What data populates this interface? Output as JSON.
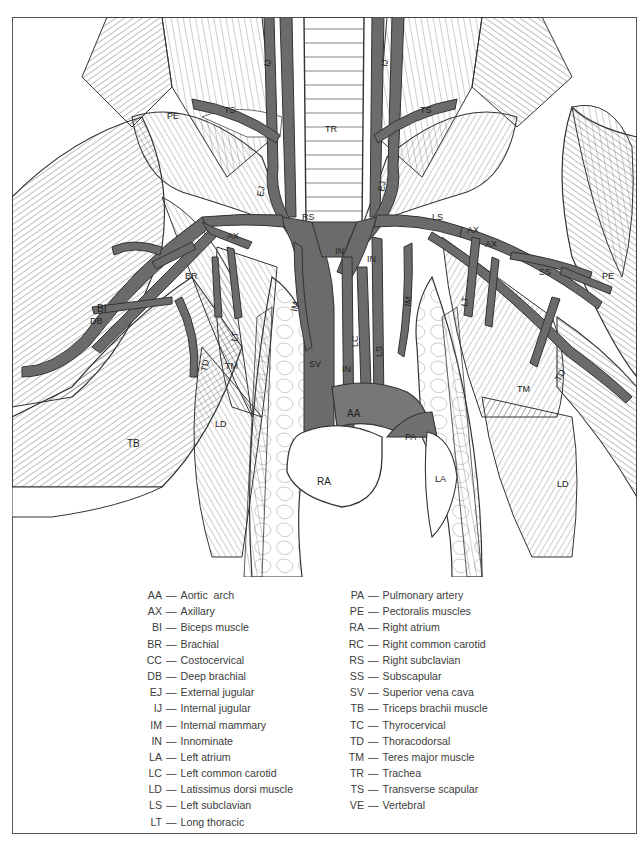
{
  "figure": {
    "vessel_color": "#6b6b6b",
    "heart_color": "#777777",
    "labels": {
      "TR": "TR",
      "EJ_left": "EJ",
      "EJ_right": "EJ",
      "IJ_left": "IJ",
      "IJ_right": "IJ",
      "RS": "RS",
      "LS": "LS",
      "IN_left": "IN",
      "IN_center": "IN",
      "IN_lower": "IN",
      "SV": "SV",
      "RC": "RC",
      "LC": "LC",
      "LS_lower": "LS",
      "IM_left": "IM",
      "IM_right": "IM",
      "AA": "AA",
      "PA": "PA",
      "RA": "RA",
      "LA": "LA",
      "AX_left1": "AX",
      "AX_left2": "AX",
      "AX_right1": "AX",
      "AX_right2": "AX",
      "BI": "BI",
      "BR": "BR",
      "DB": "DB",
      "TB": "TB",
      "TD_left": "TD",
      "TD_right": "TD",
      "TM_left": "TM",
      "TM_right": "TM",
      "LD_left": "LD",
      "LD_right": "LD",
      "LT_left": "LT",
      "LT_right": "LT",
      "PE_left": "PE",
      "PE_right": "PE",
      "TS_left": "TS",
      "TS_right": "TS",
      "SS": "SS",
      "VE": "VE",
      "TC": "TC"
    }
  },
  "legend": {
    "dash": "—",
    "left": [
      {
        "abbr": "AA",
        "name": "Aortic  arch"
      },
      {
        "abbr": "AX",
        "name": "Axillary"
      },
      {
        "abbr": "BI",
        "name": "Biceps muscle"
      },
      {
        "abbr": "BR",
        "name": "Brachial"
      },
      {
        "abbr": "CC",
        "name": "Costocervical"
      },
      {
        "abbr": "DB",
        "name": "Deep brachial"
      },
      {
        "abbr": "EJ",
        "name": "External jugular"
      },
      {
        "abbr": "IJ",
        "name": "Internal jugular"
      },
      {
        "abbr": "IM",
        "name": "Internal mammary"
      },
      {
        "abbr": "IN",
        "name": "Innominate"
      },
      {
        "abbr": "LA",
        "name": "Left atrium"
      },
      {
        "abbr": "LC",
        "name": "Left common carotid"
      },
      {
        "abbr": "LD",
        "name": "Latissimus dorsi muscle"
      },
      {
        "abbr": "LS",
        "name": "Left subclavian"
      },
      {
        "abbr": "LT",
        "name": "Long thoracic"
      }
    ],
    "right": [
      {
        "abbr": "PA",
        "name": "Pulmonary artery"
      },
      {
        "abbr": "PE",
        "name": "Pectoralis muscles"
      },
      {
        "abbr": "RA",
        "name": "Right atrium"
      },
      {
        "abbr": "RC",
        "name": "Right common carotid"
      },
      {
        "abbr": "RS",
        "name": "Right subclavian"
      },
      {
        "abbr": "SS",
        "name": "Subscapular"
      },
      {
        "abbr": "SV",
        "name": "Superior vena cava"
      },
      {
        "abbr": "TB",
        "name": "Triceps brachii muscle"
      },
      {
        "abbr": "TC",
        "name": "Thyrocervical"
      },
      {
        "abbr": "TD",
        "name": "Thoracodorsal"
      },
      {
        "abbr": "TM",
        "name": "Teres major muscle"
      },
      {
        "abbr": "TR",
        "name": "Trachea"
      },
      {
        "abbr": "TS",
        "name": "Transverse scapular"
      },
      {
        "abbr": "VE",
        "name": "Vertebral"
      }
    ]
  }
}
